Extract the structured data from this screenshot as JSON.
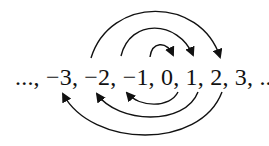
{
  "diagram": {
    "type": "integer-bijection-arrows",
    "sequence_text": "..., −3, −2, −1, 0, 1, 2, 3, ...",
    "terms": [
      "...",
      "−3",
      "−2",
      "−1",
      "0",
      "1",
      "2",
      "3",
      "..."
    ],
    "top_arrows": [
      {
        "from": "−1",
        "to": "1"
      },
      {
        "from": "−2",
        "to": "2"
      },
      {
        "from": "−3",
        "to": "3"
      }
    ],
    "bottom_arrows": [
      {
        "from": "1",
        "to": "−1"
      },
      {
        "from": "2",
        "to": "−2"
      },
      {
        "from": "3",
        "to": "−3"
      }
    ],
    "colors": {
      "stroke": "#111111",
      "background": "#ffffff"
    }
  }
}
